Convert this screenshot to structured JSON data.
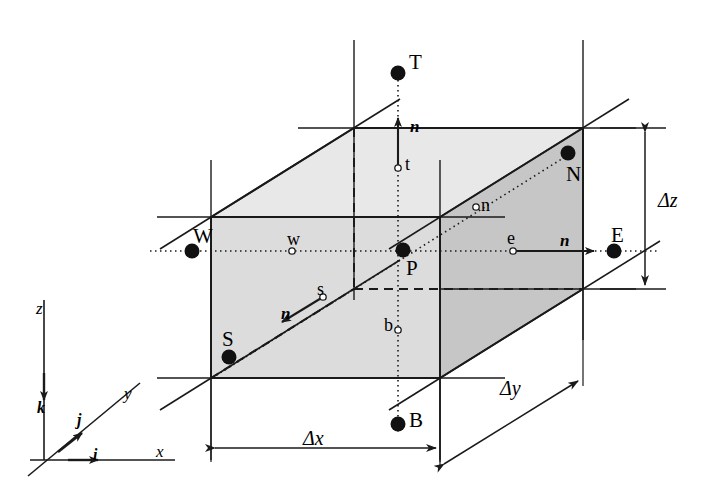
{
  "figure": {
    "colors": {
      "line": "#1a1a1a",
      "face_shade_front": "#d9d9d9",
      "face_shade_east": "#c4c4c4",
      "face_shade_top": "#e6e6e6",
      "background": "#ffffff"
    }
  },
  "nodes": [
    {
      "id": "P",
      "label": "P",
      "x": 403,
      "y": 250,
      "label_x": 406,
      "label_y": 258
    },
    {
      "id": "W",
      "label": "W",
      "x": 192,
      "y": 251,
      "label_x": 193,
      "label_y": 226
    },
    {
      "id": "E",
      "label": "E",
      "x": 614,
      "y": 251,
      "label_x": 611,
      "label_y": 225
    },
    {
      "id": "S",
      "label": "S",
      "x": 229,
      "y": 357,
      "label_x": 222,
      "label_y": 329
    },
    {
      "id": "N",
      "label": "N",
      "x": 568,
      "y": 153,
      "label_x": 566,
      "label_y": 164
    },
    {
      "id": "T",
      "label": "T",
      "x": 398,
      "y": 73,
      "label_x": 409,
      "label_y": 52
    },
    {
      "id": "B",
      "label": "B",
      "x": 398,
      "y": 424,
      "label_x": 409,
      "label_y": 410
    }
  ],
  "face_centres": [
    {
      "id": "w",
      "label": "w",
      "x": 292,
      "y": 251,
      "label_x": 287,
      "label_y": 230
    },
    {
      "id": "e",
      "label": "e",
      "x": 513,
      "y": 251,
      "label_x": 507,
      "label_y": 229
    },
    {
      "id": "s",
      "label": "s",
      "x": 323,
      "y": 297,
      "label_x": 317,
      "label_y": 280
    },
    {
      "id": "n",
      "label": "n",
      "x": 476,
      "y": 207,
      "label_x": 481,
      "label_y": 196
    },
    {
      "id": "t",
      "label": "t",
      "x": 398,
      "y": 168,
      "label_x": 405,
      "label_y": 155
    },
    {
      "id": "b",
      "label": "b",
      "x": 398,
      "y": 330,
      "label_x": 384,
      "label_y": 316
    }
  ],
  "normals": [
    {
      "id": "n-east",
      "label": "n",
      "label_x": 560,
      "label_y": 232
    },
    {
      "id": "n-top",
      "label": "n",
      "label_x": 410,
      "label_y": 118
    },
    {
      "id": "n-south",
      "label": "n",
      "label_x": 281,
      "label_y": 305
    }
  ],
  "dimensions": [
    {
      "id": "dx",
      "label": "Δx",
      "label_x": 303,
      "label_y": 428
    },
    {
      "id": "dy",
      "label": "Δy",
      "label_x": 500,
      "label_y": 378
    },
    {
      "id": "dz",
      "label": "Δz",
      "label_x": 658,
      "label_y": 190
    }
  ],
  "axes": {
    "labels": [
      {
        "id": "axis-z",
        "label": "z",
        "x": 36,
        "y": 300
      },
      {
        "id": "axis-y",
        "label": "y",
        "x": 124,
        "y": 385
      },
      {
        "id": "axis-x",
        "label": "x",
        "x": 156,
        "y": 443
      },
      {
        "id": "unit-k",
        "label": "k",
        "x": 37,
        "y": 400
      },
      {
        "id": "unit-j",
        "label": "j",
        "x": 77,
        "y": 412
      },
      {
        "id": "unit-i",
        "label": "i",
        "x": 93,
        "y": 447
      }
    ]
  }
}
